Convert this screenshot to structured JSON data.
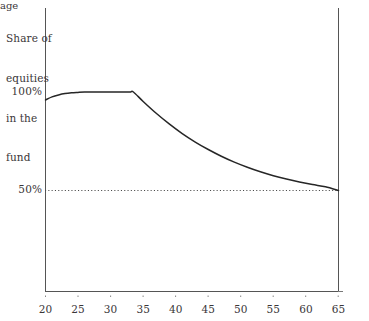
{
  "chart_data": {
    "type": "line",
    "title": "",
    "subtitle": "",
    "xlabel": "age",
    "ylabel": "Share of\nequities\nin the\nfund",
    "ylabel_lines": [
      "Share of",
      "equities",
      "in the",
      "fund"
    ],
    "x": [
      20,
      21,
      22,
      23,
      24,
      25,
      26,
      27,
      28,
      29,
      30,
      31,
      32,
      33,
      33.5,
      35,
      37,
      39,
      41,
      43,
      45,
      47,
      49,
      51,
      53,
      55,
      57,
      59,
      61,
      63,
      65
    ],
    "values": [
      96,
      97.5,
      98.5,
      99.2,
      99.6,
      99.8,
      99.95,
      100,
      100,
      100,
      100,
      100,
      100,
      100,
      100,
      95.2,
      89.2,
      83.8,
      78.9,
      74.6,
      70.8,
      67.4,
      64.4,
      61.8,
      59.5,
      57.5,
      55.8,
      54.3,
      53,
      51.9,
      50
    ],
    "series": [
      {
        "name": "Share of equities in the fund",
        "values": [
          96,
          97.5,
          98.5,
          99.2,
          99.6,
          99.8,
          99.95,
          100,
          100,
          100,
          100,
          100,
          100,
          100,
          100,
          95.2,
          89.2,
          83.8,
          78.9,
          74.6,
          70.8,
          67.4,
          64.4,
          61.8,
          59.5,
          57.5,
          55.8,
          54.3,
          53,
          51.9,
          50
        ],
        "color": "#262626"
      }
    ],
    "xlim": [
      20,
      65
    ],
    "ylim": [
      0,
      103
    ],
    "xticks": [
      20,
      25,
      30,
      35,
      40,
      45,
      50,
      55,
      60,
      65
    ],
    "xtick_labels": [
      "20",
      "25",
      "30",
      "35",
      "40",
      "45",
      "50",
      "55",
      "60",
      "65"
    ],
    "yticks": [
      50,
      100
    ],
    "ytick_labels": [
      "50%",
      "100%"
    ],
    "grid": false,
    "legend": "none",
    "annotations": [
      {
        "name": "fifty-percent-reference-line",
        "type": "hline",
        "y": 50,
        "style": "dotted",
        "label": "50%"
      },
      {
        "name": "retirement-age-line",
        "type": "vline",
        "x": 65,
        "style": "solid",
        "label": "65"
      }
    ],
    "plateau_start_age": 26,
    "plateau_end_age": 33.5,
    "start_value": 96,
    "peak_value": 100,
    "end_value": 50,
    "colors": {
      "curve": "#262626",
      "axis": "#555555",
      "text": "#3a3638",
      "dotted": "#4a4a4a",
      "background": "#ffffff"
    }
  }
}
